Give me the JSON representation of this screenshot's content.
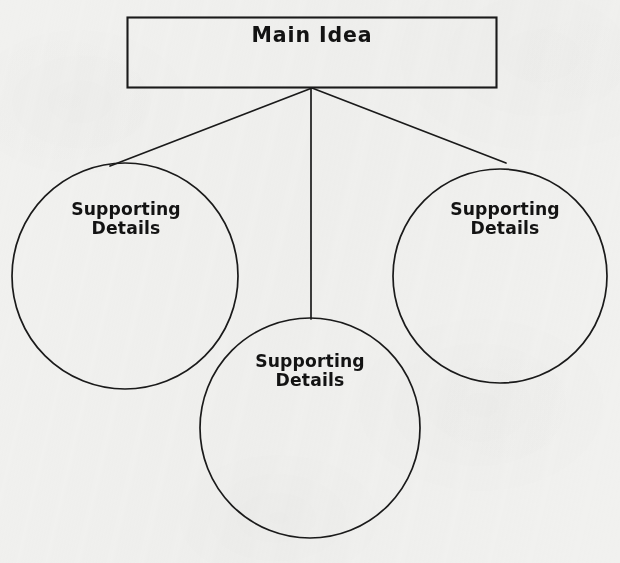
{
  "diagram": {
    "type": "hierarchy-web",
    "background_color": "#f1f1ef",
    "stroke_color": "#1a1a1a",
    "text_color": "#131313",
    "nodes": {
      "main": {
        "label": "Main Idea",
        "shape": "rectangle",
        "x": 127,
        "y": 17,
        "width": 370,
        "height": 71
      },
      "left": {
        "label": "Supporting\nDetails",
        "shape": "circle",
        "cx": 125,
        "cy": 276,
        "r": 113
      },
      "center": {
        "label": "Supporting\nDetails",
        "shape": "circle",
        "cx": 310,
        "cy": 428,
        "r": 110
      },
      "right": {
        "label": "Supporting\nDetails",
        "shape": "circle",
        "cx": 500,
        "cy": 276,
        "r": 107
      }
    },
    "connectors": [
      {
        "name": "main-to-left",
        "from": [
          312,
          88
        ],
        "to": [
          110,
          166
        ]
      },
      {
        "name": "main-to-center",
        "from": [
          311,
          88
        ],
        "to": [
          311,
          319
        ]
      },
      {
        "name": "main-to-right",
        "from": [
          312,
          88
        ],
        "to": [
          506,
          163
        ]
      }
    ]
  }
}
